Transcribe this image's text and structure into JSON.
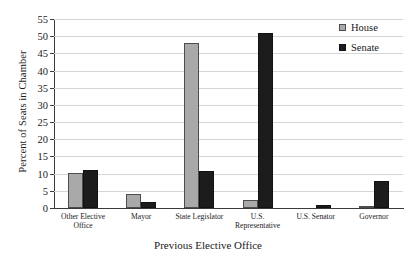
{
  "chart_data": {
    "type": "bar",
    "title": "",
    "xlabel": "Previous Elective Office",
    "ylabel": "Percent of Seats in Chamber",
    "categories": [
      "Other Elective Office",
      "Mayor",
      "State Legislator",
      "U.S. Representative",
      "U.S. Senator",
      "Governor"
    ],
    "category_lines": [
      [
        "Other Elective",
        "Office"
      ],
      [
        "Mayor"
      ],
      [
        "State Legislator"
      ],
      [
        "U.S.",
        "Representative"
      ],
      [
        "U.S. Senator"
      ],
      [
        "Governor"
      ]
    ],
    "series": [
      {
        "name": "House",
        "color": "#a9a9a9",
        "values": [
          10.3,
          4.2,
          47.9,
          2.4,
          0,
          0.1
        ]
      },
      {
        "name": "Senate",
        "color": "#1c1c1c",
        "values": [
          11.0,
          1.8,
          10.9,
          50.9,
          1.0,
          7.8
        ]
      }
    ],
    "ylim": [
      0,
      55
    ],
    "ytick_step": 5,
    "yticks": [
      0,
      5,
      10,
      15,
      20,
      25,
      30,
      35,
      40,
      45,
      50,
      55
    ],
    "grid": true,
    "legend_position": "top-right"
  },
  "legend": {
    "entries": [
      {
        "label": "House",
        "swatch": "house"
      },
      {
        "label": "Senate",
        "swatch": "senate"
      }
    ]
  }
}
